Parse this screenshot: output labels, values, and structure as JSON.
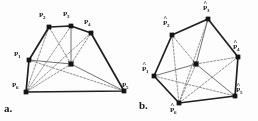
{
  "figure": {
    "panels": [
      {
        "id": "a",
        "letter_label": "a."
      },
      {
        "id": "b",
        "letter_label": "b."
      }
    ],
    "panel_a": {
      "letter": "a.",
      "vertex_labels": [
        {
          "base": "P",
          "sub": "1"
        },
        {
          "base": "P",
          "sub": "2"
        },
        {
          "base": "P",
          "sub": "3"
        },
        {
          "base": "P",
          "sub": "4"
        },
        {
          "base": "P",
          "sub": "5"
        },
        {
          "base": "P",
          "sub": "6"
        }
      ]
    },
    "panel_b": {
      "letter": "b.",
      "vertex_labels": [
        {
          "base": "P",
          "sub": "1",
          "hat": true
        },
        {
          "base": "P",
          "sub": "2",
          "hat": true
        },
        {
          "base": "P",
          "sub": "3",
          "hat": true
        },
        {
          "base": "P",
          "sub": "4",
          "hat": true
        },
        {
          "base": "P",
          "sub": "5",
          "hat": true
        },
        {
          "base": "P",
          "sub": "6",
          "hat": true
        }
      ]
    }
  },
  "chart_data": {
    "type": "diagram",
    "title": "",
    "subtitle": "",
    "colors": {
      "outline": "#1f1f1f",
      "spoke": "#5a5a5a",
      "dashed": "#6e6e6e",
      "node": "#151515",
      "background": "#fefefe"
    },
    "stroke_widths": {
      "outline": 1.7,
      "spoke": 0.85,
      "dashed": 0.75
    },
    "panels": [
      {
        "id": "a",
        "letter": "a.",
        "letter_pos": [
          4,
          103
        ],
        "center": {
          "name": "C",
          "x": 71,
          "y": 64
        },
        "vertices": [
          {
            "name": "P1",
            "sub": "1",
            "x": 29,
            "y": 60,
            "label_x": 14,
            "label_y": 51,
            "hat": false
          },
          {
            "name": "P2",
            "sub": "2",
            "x": 49,
            "y": 27,
            "label_x": 39,
            "label_y": 12,
            "hat": false
          },
          {
            "name": "P3",
            "sub": "3",
            "x": 71,
            "y": 26,
            "label_x": 63,
            "label_y": 11,
            "hat": false
          },
          {
            "name": "P4",
            "sub": "4",
            "x": 91,
            "y": 33,
            "label_x": 84,
            "label_y": 19,
            "hat": false
          },
          {
            "name": "P5",
            "sub": "5",
            "x": 124,
            "y": 91,
            "label_x": 122,
            "label_y": 82,
            "hat": false
          },
          {
            "name": "P6",
            "sub": "6",
            "x": 26,
            "y": 92,
            "label_x": 12,
            "label_y": 82,
            "hat": false
          }
        ],
        "outline_order": [
          "P1",
          "P2",
          "P3",
          "P4",
          "P5",
          "P6"
        ],
        "spokes": [
          "P1",
          "P2",
          "P3",
          "P4",
          "P5",
          "P6"
        ],
        "dashed_chords": [
          [
            "P1",
            "P5"
          ],
          [
            "P2",
            "P6"
          ],
          [
            "P3",
            "P6"
          ],
          [
            "P4",
            "P6"
          ]
        ]
      },
      {
        "id": "b",
        "letter": "b.",
        "letter_pos": [
          139,
          100
        ],
        "center": {
          "name": "C",
          "x": 196,
          "y": 64
        },
        "vertices": [
          {
            "name": "P1",
            "sub": "1",
            "x": 154,
            "y": 76,
            "label_x": 142,
            "label_y": 66,
            "hat": true
          },
          {
            "name": "P2",
            "sub": "2",
            "x": 172,
            "y": 35,
            "label_x": 163,
            "label_y": 20,
            "hat": true
          },
          {
            "name": "P3",
            "sub": "3",
            "x": 208,
            "y": 19,
            "label_x": 203,
            "label_y": 5,
            "hat": true
          },
          {
            "name": "P4",
            "sub": "4",
            "x": 238,
            "y": 57,
            "label_x": 233,
            "label_y": 44,
            "hat": true
          },
          {
            "name": "P5",
            "sub": "5",
            "x": 235,
            "y": 96,
            "label_x": 236,
            "label_y": 87,
            "hat": true
          },
          {
            "name": "P6",
            "sub": "6",
            "x": 179,
            "y": 103,
            "label_x": 170,
            "label_y": 107,
            "hat": true
          }
        ],
        "outline_order": [
          "P1",
          "P2",
          "P3",
          "P4",
          "P5",
          "P6"
        ],
        "spokes": [
          "P1",
          "P2",
          "P3",
          "P4",
          "P5",
          "P6"
        ],
        "dashed_chords": [
          [
            "P1",
            "P5"
          ],
          [
            "P2",
            "P6"
          ],
          [
            "P3",
            "P6"
          ],
          [
            "P4",
            "P6"
          ]
        ]
      }
    ]
  }
}
